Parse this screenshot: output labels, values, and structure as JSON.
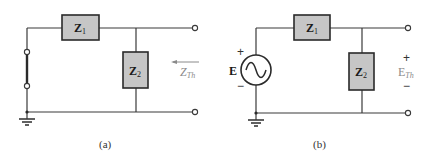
{
  "colors": {
    "wire": "#3a3a3a",
    "box_fill": "#c6c6c6",
    "label": "#1a1a1a",
    "gray_label": "#8a8a8a"
  },
  "circuit_a": {
    "caption": "(a)",
    "z1": {
      "main": "Z",
      "sub": "1"
    },
    "z2": {
      "main": "Z",
      "sub": "2"
    },
    "zth": {
      "main": "Z",
      "sub": "Th"
    },
    "arrow_direction": "left"
  },
  "circuit_b": {
    "caption": "(b)",
    "source_label": "E",
    "source_plus": "+",
    "source_minus": "−",
    "z1": {
      "main": "Z",
      "sub": "1"
    },
    "z2": {
      "main": "Z",
      "sub": "2"
    },
    "eth": {
      "main": "E",
      "sub": "Th"
    },
    "eth_plus": "+",
    "eth_minus": "−"
  }
}
